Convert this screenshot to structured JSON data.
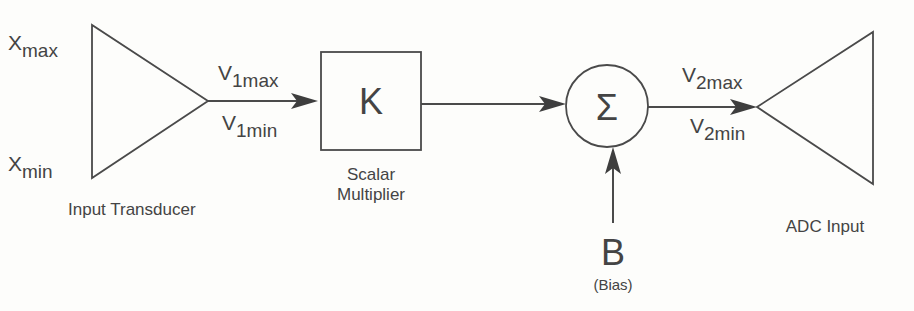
{
  "diagram": {
    "blocks": {
      "input_transducer": {
        "label": "Input Transducer",
        "inputs": {
          "max": {
            "base": "X",
            "sub": "max"
          },
          "min": {
            "base": "X",
            "sub": "min"
          }
        }
      },
      "scalar_multiplier": {
        "symbol": "K",
        "label_line1": "Scalar",
        "label_line2": "Multiplier"
      },
      "summer": {
        "symbol": "Σ"
      },
      "bias": {
        "symbol": "B",
        "label": "(Bias)"
      },
      "adc": {
        "label": "ADC Input"
      }
    },
    "signals": {
      "v1": {
        "max": {
          "base": "V",
          "sub": "1max"
        },
        "min": {
          "base": "V",
          "sub": "1min"
        }
      },
      "v2": {
        "max": {
          "base": "V",
          "sub": "2max"
        },
        "min": {
          "base": "V",
          "sub": "2min"
        }
      }
    },
    "colors": {
      "stroke": "#4a4a4a",
      "text": "#444444",
      "background": "#fdfdfb"
    }
  }
}
